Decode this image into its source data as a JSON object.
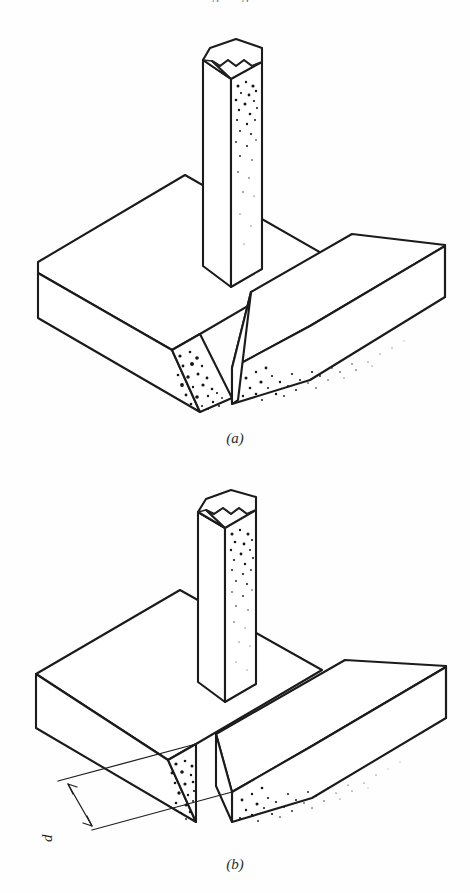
{
  "page": {
    "background_color": "#fefefe",
    "ink_color": "#1b1b1b",
    "cut_off_running_head": "g g"
  },
  "figure_panels": [
    {
      "id": "a",
      "caption": "(a)",
      "joint_type": "single-bevel groove butt joint",
      "description": "Isometric line drawing of a thick base plate split into two pieces with a bevelled (angled) groove face, and a square bar standing vertically on the plate",
      "parts": [
        {
          "name": "left-base-plate",
          "shading": "none",
          "edge_face": "bevelled"
        },
        {
          "name": "right-base-plate",
          "shading": "stipple",
          "edge_face": "bevelled"
        },
        {
          "name": "vertical-bar",
          "shading": "stipple",
          "top": "fractured"
        }
      ],
      "annotations": []
    },
    {
      "id": "b",
      "caption": "(b)",
      "joint_type": "square groove butt joint with root opening",
      "description": "Isometric line drawing of a thick base plate split into two pieces with square (vertical) groove faces separated by a root opening, and a square bar standing vertically on the plate",
      "parts": [
        {
          "name": "left-base-plate",
          "shading": "stipple",
          "edge_face": "square"
        },
        {
          "name": "right-base-plate",
          "shading": "stipple",
          "edge_face": "square"
        },
        {
          "name": "vertical-bar",
          "shading": "stipple",
          "top": "fractured"
        }
      ],
      "annotations": [
        {
          "name": "root-opening-dimension",
          "label": "d",
          "label_rotation_deg": -90,
          "style": "double-headed arrow between two extension lines"
        }
      ]
    }
  ]
}
